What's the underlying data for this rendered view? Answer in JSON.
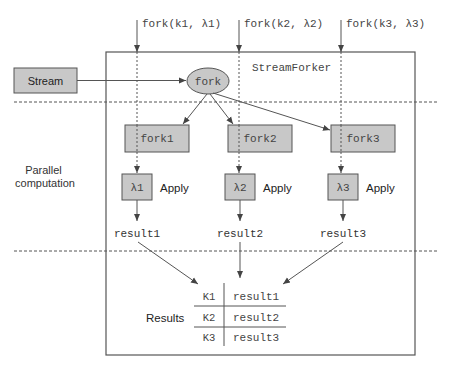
{
  "diagram": {
    "container_label": "StreamForker",
    "stream_label": "Stream",
    "fork_node_label": "fork",
    "side_labels": {
      "parallel": [
        "Parallel",
        "computation"
      ],
      "results": "Results"
    },
    "fork_calls": [
      {
        "label": "fork(k1, λ1)"
      },
      {
        "label": "fork(k2, λ2)"
      },
      {
        "label": "fork(k3, λ3)"
      }
    ],
    "fork_boxes": [
      "fork1",
      "fork2",
      "fork3"
    ],
    "lambda_boxes": [
      {
        "label": "λ1",
        "action": "Apply"
      },
      {
        "label": "λ2",
        "action": "Apply"
      },
      {
        "label": "λ3",
        "action": "Apply"
      }
    ],
    "results_labels": [
      "result1",
      "result2",
      "result3"
    ],
    "results_table": [
      {
        "key": "K1",
        "value": "result1"
      },
      {
        "key": "K2",
        "value": "result2"
      },
      {
        "key": "K3",
        "value": "result3"
      }
    ],
    "colors": {
      "box_fill": "#c8c8c8",
      "stroke": "#555555",
      "text": "#333333",
      "background": "#ffffff"
    }
  }
}
